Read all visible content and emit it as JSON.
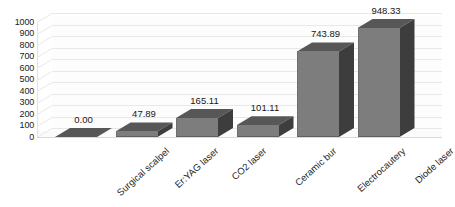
{
  "chart_data": {
    "type": "bar",
    "title": "",
    "subtitle": "",
    "xlabel": "",
    "ylabel": "",
    "categories": [
      "Surgical scalpel",
      "Er:YAG laser",
      "CO2 laser",
      "Ceramic bur",
      "Electrocautery",
      "Diode laser"
    ],
    "values": [
      0.0,
      47.89,
      165.11,
      101.11,
      743.89,
      948.33
    ],
    "value_labels": [
      "0.00",
      "47.89",
      "165.11",
      "101.11",
      "743.89",
      "948.33"
    ],
    "ylim": [
      0,
      1000
    ],
    "ytick_labels": [
      "1000",
      "900",
      "800",
      "700",
      "600",
      "500",
      "400",
      "300",
      "200",
      "100",
      "0"
    ],
    "ytick_values": [
      1000,
      900,
      800,
      700,
      600,
      500,
      400,
      300,
      200,
      100,
      0
    ],
    "grid": true,
    "legend": false,
    "legend_position": "none",
    "rendering": "3d-column",
    "colors": {
      "bar_front": "#7d7d7d",
      "bar_top": "#575757",
      "bar_side": "#3d3d3d",
      "gridline": "#e8e8e8",
      "background": "#ffffff",
      "text": "#1d1d1d"
    }
  }
}
